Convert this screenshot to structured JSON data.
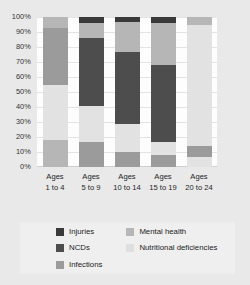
{
  "chart_data": {
    "type": "bar",
    "subtype": "stacked-100-percent",
    "title": "",
    "xlabel": "",
    "ylabel": "",
    "ylim": [
      0,
      100
    ],
    "yticks": [
      "0%",
      "10%",
      "20%",
      "30%",
      "40%",
      "50%",
      "60%",
      "70%",
      "80%",
      "90%",
      "100%"
    ],
    "grid": true,
    "legend_position": "bottom",
    "orientation": "vertical",
    "categories": [
      "Ages 1 to 4",
      "Ages 5 to 9",
      "Ages 10 to 14",
      "Ages 15 to 19",
      "Ages 20 to 24"
    ],
    "category_lines": [
      [
        "Ages",
        "1 to 4"
      ],
      [
        "Ages",
        "5 to 9"
      ],
      [
        "Ages",
        "10 to 14"
      ],
      [
        "Ages",
        "15 to 19"
      ],
      [
        "Ages",
        "20 to 24"
      ]
    ],
    "series": [
      {
        "name": "Injuries",
        "color": "#3a3a3a",
        "values": [
          0,
          4,
          3,
          4,
          0
        ]
      },
      {
        "name": "NCDs",
        "color": "#4d4d4d",
        "values": [
          0,
          45,
          47,
          51,
          0
        ]
      },
      {
        "name": "Infections",
        "color": "#9b9b9b",
        "values": [
          18,
          17,
          10,
          8,
          7
        ]
      },
      {
        "name": "Mental health",
        "color": "#b6b6b6",
        "values": [
          45,
          11,
          21,
          28,
          5
        ]
      },
      {
        "name": "Nutritional deficiencies",
        "color": "#e2e2e2",
        "values": [
          37,
          23,
          19,
          9,
          88
        ]
      }
    ],
    "stack_order_bottom_to_top": [
      "Nutritional deficiencies",
      "Infections",
      "NCDs",
      "Mental health",
      "Injuries"
    ],
    "bars": [
      {
        "category": "Ages 1 to 4",
        "segments_top_to_bottom": [
          {
            "name": "Mental health",
            "from": 100,
            "to": 93,
            "value": 7
          },
          {
            "name": "Infections",
            "from": 93,
            "to": 55,
            "value": 38
          },
          {
            "name": "Nutritional deficiencies",
            "from": 55,
            "to": 18,
            "value": 37
          },
          {
            "name": "Mental health",
            "from": 18,
            "to": 0,
            "value": 18
          }
        ]
      },
      {
        "category": "Ages 5 to 9",
        "segments_top_to_bottom": [
          {
            "name": "Injuries",
            "from": 100,
            "to": 96,
            "value": 4
          },
          {
            "name": "Mental health",
            "from": 96,
            "to": 86,
            "value": 10
          },
          {
            "name": "NCDs",
            "from": 86,
            "to": 41,
            "value": 45
          },
          {
            "name": "Nutritional deficiencies",
            "from": 41,
            "to": 17,
            "value": 24
          },
          {
            "name": "Infections",
            "from": 17,
            "to": 0,
            "value": 17
          }
        ]
      },
      {
        "category": "Ages 10 to 14",
        "segments_top_to_bottom": [
          {
            "name": "Injuries",
            "from": 100,
            "to": 97,
            "value": 3
          },
          {
            "name": "Mental health",
            "from": 97,
            "to": 77,
            "value": 20
          },
          {
            "name": "NCDs",
            "from": 77,
            "to": 29,
            "value": 48
          },
          {
            "name": "Nutritional deficiencies",
            "from": 29,
            "to": 10,
            "value": 19
          },
          {
            "name": "Infections",
            "from": 10,
            "to": 0,
            "value": 10
          }
        ]
      },
      {
        "category": "Ages 15 to 19",
        "segments_top_to_bottom": [
          {
            "name": "Injuries",
            "from": 100,
            "to": 96,
            "value": 4
          },
          {
            "name": "Mental health",
            "from": 96,
            "to": 68,
            "value": 28
          },
          {
            "name": "NCDs",
            "from": 68,
            "to": 17,
            "value": 51
          },
          {
            "name": "Nutritional deficiencies",
            "from": 17,
            "to": 8,
            "value": 9
          },
          {
            "name": "Infections",
            "from": 8,
            "to": 0,
            "value": 8
          }
        ]
      },
      {
        "category": "Ages 20 to 24",
        "segments_top_to_bottom": [
          {
            "name": "Mental health",
            "from": 100,
            "to": 95,
            "value": 5
          },
          {
            "name": "Nutritional deficiencies",
            "from": 95,
            "to": 64,
            "value": 31
          },
          {
            "name": "Nutritional deficiencies",
            "from": 64,
            "to": 14,
            "value": 50
          },
          {
            "name": "Infections",
            "from": 14,
            "to": 7,
            "value": 7
          },
          {
            "name": "Nutritional deficiencies",
            "from": 7,
            "to": 0,
            "value": 7
          }
        ]
      }
    ],
    "legend": {
      "columns": [
        [
          {
            "label": "Injuries",
            "color": "#3a3a3a"
          },
          {
            "label": "NCDs",
            "color": "#4d4d4d"
          },
          {
            "label": "Infections",
            "color": "#9b9b9b"
          }
        ],
        [
          {
            "label": "Mental health",
            "color": "#b6b6b6"
          },
          {
            "label": "Nutritional deficiencies",
            "color": "#dedede"
          }
        ]
      ]
    }
  },
  "colors": {
    "page_background": "#e9e9e9",
    "plot_background": "#fdfdfd",
    "gridline": "#e3e3e3",
    "legend_background": "#efefef",
    "text": "#2b2b2b"
  }
}
